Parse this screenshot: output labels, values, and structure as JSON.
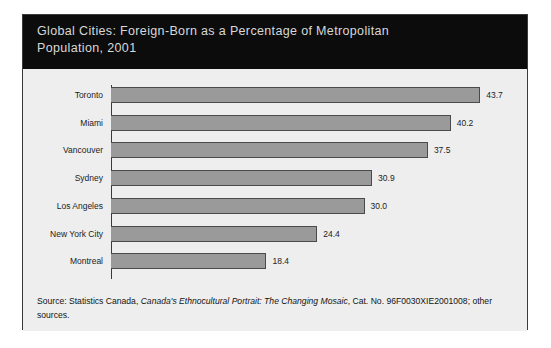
{
  "figure": {
    "title": "Global Cities: Foreign-Born as a Percentage of Metropolitan\nPopulation, 2001",
    "source": {
      "prefix": "Source: Statistics Canada, ",
      "publication": "Canada's Ethnocultural Portrait: The Changing Mosaic",
      "suffix": ", Cat. No. 96F0030XIE2001008; other sources."
    },
    "colors": {
      "header_background": "#0c0c0c",
      "header_text": "#d8d8d8",
      "panel_background": "#eeeeee",
      "bar_fill": "#9a9a9a",
      "bar_edge": "#4a4a4a",
      "frame": "#3a3a3a",
      "text": "#1c1c1c"
    }
  },
  "chart_data": {
    "type": "bar",
    "orientation": "horizontal",
    "title": "Global Cities: Foreign-Born as a Percentage of Metropolitan Population, 2001",
    "xlabel": "",
    "ylabel": "",
    "xlim": [
      0,
      45
    ],
    "grid": false,
    "legend": null,
    "value_suffix": "",
    "categories": [
      "Toronto",
      "Miami",
      "Vancouver",
      "Sydney",
      "Los Angeles",
      "New York City",
      "Montreal"
    ],
    "values": [
      43.7,
      40.2,
      37.5,
      30.9,
      30.0,
      24.4,
      18.4
    ],
    "value_labels": [
      "43.7",
      "40.2",
      "37.5",
      "30.9",
      "30.0",
      "24.4",
      "18.4"
    ]
  }
}
